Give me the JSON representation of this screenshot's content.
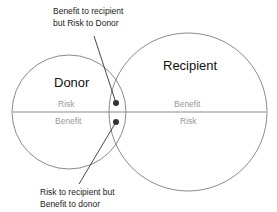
{
  "diagram": {
    "type": "venn",
    "circles": [
      {
        "id": "donor",
        "label": "Donor",
        "upper_half": "Risk",
        "lower_half": "Benefit"
      },
      {
        "id": "recipient",
        "label": "Recipient",
        "upper_half": "Benefit",
        "lower_half": "Risk"
      }
    ],
    "callouts": {
      "top": {
        "line1": "Benefit to recipient",
        "line2": "but Risk to Donor"
      },
      "bottom": {
        "line1": "Risk to recipient but",
        "line2": "Benefit to donor"
      }
    },
    "colors": {
      "circle_stroke": "#8a8a8a",
      "half_text": "#999999",
      "dot": "#333333"
    }
  }
}
